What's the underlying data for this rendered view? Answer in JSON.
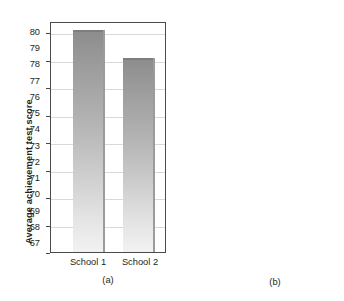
{
  "figure": {
    "panels": [
      {
        "caption": "(a)",
        "ylabel": "Average achievement test score",
        "categories": [
          "School 1",
          "School 2"
        ],
        "values": [
          80,
          70
        ],
        "ticks": [
          0,
          10,
          20,
          30,
          40,
          50,
          60,
          70,
          80
        ],
        "ylim": [
          0,
          84
        ],
        "gridlines": [
          10,
          20,
          30,
          40,
          50,
          60,
          70,
          80
        ]
      },
      {
        "caption": "(b)",
        "ylabel": "Average achievement test score",
        "categories": [
          "School 1",
          "School 2"
        ],
        "values": [
          80,
          70
        ],
        "ticks": [
          67,
          68,
          69,
          70,
          71,
          72,
          73,
          74,
          75,
          76,
          77,
          78,
          79,
          80
        ],
        "ylim": [
          66.4,
          80.6
        ],
        "gridlines": [
          68,
          70,
          72,
          74,
          76,
          78,
          80
        ]
      }
    ]
  },
  "chart_data": [
    {
      "type": "bar",
      "title": "",
      "subtitle": "",
      "categories": [
        "School 1",
        "School 2"
      ],
      "values": [
        80,
        70
      ],
      "series": [
        {
          "name": "Average achievement test score",
          "values": [
            80,
            70
          ]
        }
      ],
      "xlabel": "",
      "ylabel": "Average achievement test score",
      "ylim": [
        0,
        84
      ],
      "yticks": [
        0,
        10,
        20,
        30,
        40,
        50,
        60,
        70,
        80
      ],
      "ytick_step": 10,
      "grid": true,
      "gridline_values": [
        10,
        20,
        30,
        40,
        50,
        60,
        70,
        80
      ],
      "legend": false,
      "annotation": "(a)",
      "bar_color": "#b0b0b0",
      "bar_fill": "vertical-gradient-dark-top-light-bottom"
    },
    {
      "type": "bar",
      "title": "",
      "subtitle": "",
      "categories": [
        "School 1",
        "School 2"
      ],
      "values": [
        80,
        70
      ],
      "series": [
        {
          "name": "Average achievement test score",
          "values": [
            80,
            70
          ]
        }
      ],
      "xlabel": "",
      "ylabel": "Average achievement test score",
      "ylim": [
        66.4,
        80.6
      ],
      "yticks": [
        67,
        68,
        69,
        70,
        71,
        72,
        73,
        74,
        75,
        76,
        77,
        78,
        79,
        80
      ],
      "ytick_step": 1,
      "grid": true,
      "gridline_values": [
        68,
        70,
        72,
        74,
        76,
        78,
        80
      ],
      "legend": false,
      "annotation": "(b)",
      "bar_color": "#b0b0b0",
      "bar_fill": "vertical-gradient-dark-top-light-bottom"
    }
  ],
  "colors": {
    "background": "#ffffff",
    "frame": "#4a4a4a",
    "grid": "#d9d9d9",
    "text": "#231f20",
    "bar_top": "#8c8c8c",
    "bar_bottom": "#f2f2f2"
  }
}
